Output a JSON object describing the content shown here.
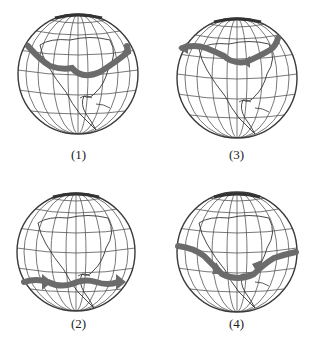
{
  "figure": {
    "colors": {
      "band": "#6b6b6b",
      "outline": "#3a3a3a",
      "grid": "#555555",
      "background": "#ffffff"
    },
    "panels": [
      {
        "id": "p1",
        "label": "(1)",
        "band": "high latitude band (~60°N) across Canada, arrow pointing east"
      },
      {
        "id": "p3",
        "label": "(3)",
        "band": "high latitude band (~60°N), arrows pointing west"
      },
      {
        "id": "p2",
        "label": "(2)",
        "band": "low latitude band (~10-15°N), arrows pointing east"
      },
      {
        "id": "p4",
        "label": "(4)",
        "band": "low/mid latitude band (~20°N), arrows converging"
      }
    ]
  }
}
